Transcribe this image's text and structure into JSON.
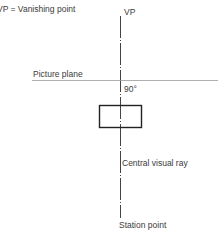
{
  "diagram": {
    "legend": "VP = Vanishing point",
    "labels": {
      "vp": "VP",
      "picture_plane": "Picture plane",
      "angle": "90°",
      "central_ray": "Central visual ray",
      "station_point": "Station point"
    },
    "colors": {
      "line": "#444444",
      "plane_line": "#9a9a9a",
      "text": "#3a3a3a"
    }
  }
}
